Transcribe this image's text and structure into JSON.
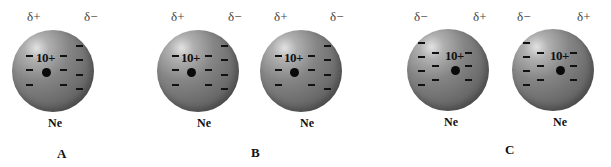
{
  "figure": {
    "panels": [
      {
        "label": "A",
        "label_pos": [
          57,
          154
        ],
        "atoms": [
          {
            "element": "Ne",
            "nuclear_charge": "10+",
            "left_pole": "δ+",
            "right_pole": "δ−",
            "center": [
              53,
              71
            ],
            "nucleus_offset": [
              -7,
              1
            ],
            "electrons": [
              [
                -24,
                -16
              ],
              [
                -24,
                -2
              ],
              [
                -24,
                13
              ],
              [
                10,
                -16
              ],
              [
                10,
                -2
              ],
              [
                10,
                13
              ],
              [
                26,
                -26
              ],
              [
                26,
                -12
              ],
              [
                26,
                3
              ],
              [
                26,
                17
              ]
            ],
            "delta_left_x": 27,
            "delta_right_x": 84,
            "ne_x": 48
          }
        ]
      },
      {
        "label": "B",
        "label_pos": [
          251,
          153
        ],
        "atoms": [
          {
            "element": "Ne",
            "nuclear_charge": "10+",
            "left_pole": "δ+",
            "right_pole": "δ−",
            "center": [
              198,
              71
            ],
            "nucleus_offset": [
              -7,
              1
            ],
            "electrons": [
              [
                -23,
                -16
              ],
              [
                -23,
                -2
              ],
              [
                -23,
                13
              ],
              [
                10,
                -16
              ],
              [
                10,
                -2
              ],
              [
                10,
                13
              ],
              [
                26,
                -26
              ],
              [
                26,
                -12
              ],
              [
                26,
                3
              ],
              [
                26,
                17
              ]
            ],
            "delta_left_x": 171,
            "delta_right_x": 228,
            "ne_x": 197
          },
          {
            "element": "Ne",
            "nuclear_charge": "10+",
            "left_pole": "δ+",
            "right_pole": "δ−",
            "center": [
              301,
              71
            ],
            "nucleus_offset": [
              -7,
              1
            ],
            "electrons": [
              [
                -23,
                -16
              ],
              [
                -23,
                -2
              ],
              [
                -23,
                13
              ],
              [
                10,
                -16
              ],
              [
                10,
                -2
              ],
              [
                10,
                13
              ],
              [
                26,
                -26
              ],
              [
                26,
                -12
              ],
              [
                26,
                3
              ],
              [
                26,
                17
              ]
            ],
            "delta_left_x": 274,
            "delta_right_x": 330,
            "ne_x": 300
          }
        ]
      },
      {
        "label": "C",
        "label_pos": [
          505,
          150
        ],
        "atoms": [
          {
            "element": "Ne",
            "nuclear_charge": "10+",
            "left_pole": "δ−",
            "right_pole": "δ+",
            "center": [
              448,
              70
            ],
            "nucleus_offset": [
              7,
              0
            ],
            "electrons": [
              [
                -27,
                -28
              ],
              [
                -27,
                -14
              ],
              [
                -27,
                0
              ],
              [
                -27,
                14
              ],
              [
                -13,
                -18
              ],
              [
                -13,
                -5
              ],
              [
                -13,
                9
              ],
              [
                20,
                -18
              ],
              [
                20,
                -5
              ],
              [
                20,
                9
              ]
            ],
            "delta_left_x": 414,
            "delta_right_x": 473,
            "ne_x": 444
          },
          {
            "element": "Ne",
            "nuclear_charge": "10+",
            "left_pole": "δ−",
            "right_pole": "δ+",
            "center": [
              553,
              70
            ],
            "nucleus_offset": [
              7,
              0
            ],
            "electrons": [
              [
                -27,
                -28
              ],
              [
                -27,
                -14
              ],
              [
                -27,
                0
              ],
              [
                -27,
                14
              ],
              [
                -13,
                -18
              ],
              [
                -13,
                -5
              ],
              [
                -13,
                9
              ],
              [
                20,
                -18
              ],
              [
                20,
                -5
              ],
              [
                20,
                9
              ]
            ],
            "delta_left_x": 517,
            "delta_right_x": 577,
            "ne_x": 553
          }
        ]
      }
    ]
  },
  "colors": {
    "background": "#ffffff",
    "atom_light": "#e2e2e2",
    "atom_mid": "#858585",
    "atom_dark": "#5a5a5a",
    "electron": "#111111",
    "nucleus": "#0a0a0a",
    "delta_text": "#444444"
  }
}
